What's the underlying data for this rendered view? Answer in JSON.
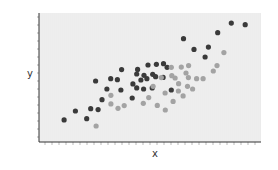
{
  "chart_data": {
    "type": "scatter",
    "title": "",
    "xlabel": "x",
    "ylabel": "y",
    "xlim": [
      0,
      100
    ],
    "ylim": [
      0,
      100
    ],
    "grid": false,
    "tick_labels": false,
    "legend": null,
    "background": "#ebebeb",
    "series": [
      {
        "name": "dark",
        "color": "#3a3a3a",
        "points": [
          [
            11.3,
            17.1
          ],
          [
            16.4,
            24.0
          ],
          [
            21.5,
            18.1
          ],
          [
            23.3,
            25.8
          ],
          [
            26.6,
            25.1
          ],
          [
            25.5,
            47.3
          ],
          [
            28.4,
            32.8
          ],
          [
            30.6,
            41.1
          ],
          [
            32.3,
            49.1
          ],
          [
            35.3,
            48.3
          ],
          [
            36.9,
            40.3
          ],
          [
            37.2,
            56.1
          ],
          [
            42.0,
            34.1
          ],
          [
            42.3,
            45.0
          ],
          [
            44.0,
            41.9
          ],
          [
            44.0,
            52.7
          ],
          [
            44.4,
            56.3
          ],
          [
            45.9,
            48.1
          ],
          [
            47.3,
            51.7
          ],
          [
            47.1,
            41.1
          ],
          [
            48.6,
            49.1
          ],
          [
            49.1,
            59.7
          ],
          [
            51.0,
            41.9
          ],
          [
            51.2,
            52.5
          ],
          [
            52.9,
            60.2
          ],
          [
            52.5,
            50.6
          ],
          [
            55.9,
            50.1
          ],
          [
            56.1,
            60.7
          ],
          [
            57.7,
            57.9
          ],
          [
            59.6,
            40.3
          ],
          [
            65.1,
            80.1
          ],
          [
            69.8,
            71.8
          ],
          [
            74.8,
            65.9
          ],
          [
            76.3,
            73.6
          ],
          [
            80.5,
            84.7
          ],
          [
            86.6,
            92.2
          ],
          [
            92.9,
            90.9
          ]
        ]
      },
      {
        "name": "light",
        "color": "#a3a3a3",
        "points": [
          [
            25.7,
            12.4
          ],
          [
            32.4,
            36.2
          ],
          [
            32.4,
            29.5
          ],
          [
            35.6,
            26.1
          ],
          [
            38.4,
            28.2
          ],
          [
            47.0,
            30.0
          ],
          [
            49.4,
            34.4
          ],
          [
            51.4,
            43.2
          ],
          [
            53.3,
            28.4
          ],
          [
            55.1,
            49.9
          ],
          [
            56.8,
            38.0
          ],
          [
            56.9,
            24.8
          ],
          [
            59.6,
            57.9
          ],
          [
            60.4,
            31.5
          ],
          [
            61.3,
            49.6
          ],
          [
            62.9,
            45.2
          ],
          [
            64.1,
            58.1
          ],
          [
            62.8,
            39.5
          ],
          [
            64.9,
            35.7
          ],
          [
            66.2,
            53.5
          ],
          [
            67.4,
            59.2
          ],
          [
            67.3,
            49.9
          ],
          [
            66.9,
            43.2
          ],
          [
            69.2,
            41.1
          ],
          [
            71.0,
            49.1
          ],
          [
            73.9,
            49.1
          ],
          [
            78.5,
            55.0
          ],
          [
            80.2,
            59.2
          ],
          [
            83.3,
            69.3
          ],
          [
            59.8,
            51.4
          ]
        ]
      }
    ]
  },
  "labels": {
    "x": "x",
    "y": "y"
  }
}
